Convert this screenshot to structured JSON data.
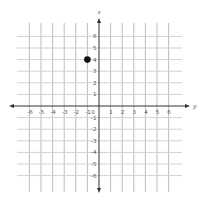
{
  "chart_data": {
    "type": "scatter",
    "title": "",
    "xlabel": "y",
    "ylabel": "x",
    "xlim": [
      -6,
      6
    ],
    "ylim": [
      -6,
      6
    ],
    "grid": true,
    "x_ticks": [
      "-6",
      "-5",
      "-4",
      "-3",
      "-2",
      "-1",
      "0",
      "1",
      "2",
      "3",
      "4",
      "5",
      "6"
    ],
    "y_ticks": [
      "6",
      "5",
      "4",
      "3",
      "2",
      "1",
      "-1",
      "-2",
      "-3",
      "-4",
      "-5",
      "-6"
    ],
    "points": [
      {
        "x": -1,
        "y": 4
      }
    ],
    "colors": {
      "point": "#111111",
      "axis": "#333333",
      "grid": "#d2d2d2"
    }
  }
}
